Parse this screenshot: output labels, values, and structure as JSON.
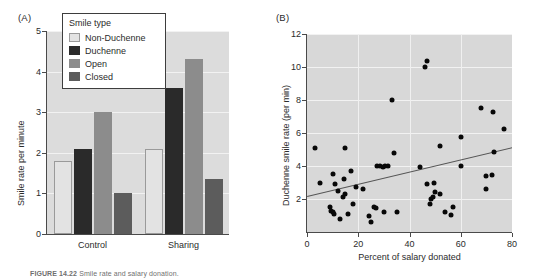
{
  "figure": {
    "caption_label": "FIGURE 14.22",
    "caption_text": "Smile rate and salary donation."
  },
  "panel_a": {
    "tag": "(A)",
    "legend": {
      "title": "Smile type",
      "items": [
        {
          "label": "Non-Duchenne",
          "swatch": "swatch-non-duchenne",
          "color": "#e3e3e3"
        },
        {
          "label": "Duchenne",
          "swatch": "swatch-duchenne",
          "color": "#2a2a2a"
        },
        {
          "label": "Open",
          "swatch": "swatch-open",
          "color": "#8c8c8c"
        },
        {
          "label": "Closed",
          "swatch": "swatch-closed",
          "color": "#5c5c5c"
        }
      ]
    },
    "chart_data": {
      "type": "bar",
      "title": "",
      "xlabel": "",
      "ylabel": "Smile rate per minute",
      "categories": [
        "Control",
        "Sharing"
      ],
      "ylim": [
        0,
        5
      ],
      "yticks": [
        0,
        1,
        2,
        3,
        4,
        5
      ],
      "grid": true,
      "legend_position": "upper-left-inset",
      "series": [
        {
          "name": "Non-Duchenne",
          "values": [
            1.8,
            2.1
          ]
        },
        {
          "name": "Duchenne",
          "values": [
            2.1,
            3.6
          ]
        },
        {
          "name": "Open",
          "values": [
            3.0,
            4.3
          ]
        },
        {
          "name": "Closed",
          "values": [
            1.0,
            1.35
          ]
        }
      ]
    }
  },
  "panel_b": {
    "tag": "(B)",
    "chart_data": {
      "type": "scatter",
      "title": "",
      "xlabel": "Percent of salary donated",
      "ylabel": "Duchenne smile rate (per min)",
      "xlim": [
        0,
        80
      ],
      "ylim": [
        0,
        12
      ],
      "xticks": [
        0,
        20,
        40,
        60,
        80
      ],
      "yticks": [
        2,
        4,
        6,
        8,
        10,
        12
      ],
      "grid": true,
      "points": [
        [
          3,
          5.1
        ],
        [
          5,
          3.0
        ],
        [
          9,
          1.5
        ],
        [
          9.5,
          1.3
        ],
        [
          10,
          1.2
        ],
        [
          10.5,
          1.1
        ],
        [
          10,
          3.5
        ],
        [
          11,
          2.9
        ],
        [
          12,
          2.5
        ],
        [
          13,
          0.8
        ],
        [
          14,
          2.1
        ],
        [
          15,
          5.1
        ],
        [
          14.5,
          3.2
        ],
        [
          15,
          2.3
        ],
        [
          16,
          1.1
        ],
        [
          17,
          3.7
        ],
        [
          18,
          1.7
        ],
        [
          19,
          2.7
        ],
        [
          22,
          2.6
        ],
        [
          24,
          1.0
        ],
        [
          25,
          0.6
        ],
        [
          26,
          1.5
        ],
        [
          27,
          1.45
        ],
        [
          27.5,
          4.0
        ],
        [
          28.5,
          4.0
        ],
        [
          29.5,
          3.95
        ],
        [
          30.5,
          4.0
        ],
        [
          31.5,
          4.0
        ],
        [
          30,
          1.2
        ],
        [
          34,
          4.8
        ],
        [
          35,
          1.2
        ],
        [
          33,
          8.0
        ],
        [
          44,
          3.95
        ],
        [
          46,
          10.0
        ],
        [
          47,
          10.35
        ],
        [
          47,
          2.9
        ],
        [
          48,
          1.7
        ],
        [
          48.5,
          2.0
        ],
        [
          49,
          2.1
        ],
        [
          49.5,
          3.0
        ],
        [
          50,
          2.4
        ],
        [
          52,
          2.3
        ],
        [
          52,
          5.2
        ],
        [
          54,
          1.2
        ],
        [
          56,
          1.05
        ],
        [
          57,
          1.5
        ],
        [
          60,
          5.75
        ],
        [
          60,
          4.0
        ],
        [
          68,
          7.5
        ],
        [
          70,
          3.4
        ],
        [
          70,
          2.6
        ],
        [
          72,
          3.45
        ],
        [
          72.5,
          7.3
        ],
        [
          73,
          4.85
        ],
        [
          77,
          6.25
        ]
      ],
      "trendline": {
        "x0": 0,
        "y0": 2.2,
        "x1": 80,
        "y1": 5.15
      }
    }
  }
}
